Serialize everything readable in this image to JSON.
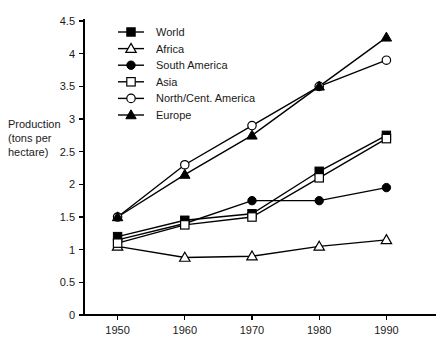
{
  "chart_data": {
    "type": "line",
    "title": "",
    "xlabel": "",
    "ylabel": "Production (tons per hectare)",
    "ylabel_lines": [
      "Production",
      "(tons per",
      "hectare)"
    ],
    "x": [
      1950,
      1960,
      1970,
      1980,
      1990
    ],
    "xtick_labels": [
      "1950",
      "1960",
      "1970",
      "1980",
      "1990"
    ],
    "ytick_labels": [
      "0",
      "0.5",
      "1",
      "1.5",
      "2",
      "2.5",
      "3",
      "3.5",
      "4",
      "4.5"
    ],
    "yticks": [
      0,
      0.5,
      1,
      1.5,
      2,
      2.5,
      3,
      3.5,
      4,
      4.5
    ],
    "ylim": [
      0,
      4.5
    ],
    "xlim": [
      1945,
      1995
    ],
    "grid": false,
    "legend_position": "top-left-inside",
    "series": [
      {
        "name": "World",
        "marker": "filled-square",
        "values": [
          1.2,
          1.45,
          1.55,
          2.2,
          2.75
        ]
      },
      {
        "name": "Africa",
        "marker": "open-triangle",
        "values": [
          1.05,
          0.88,
          0.9,
          1.05,
          1.15
        ]
      },
      {
        "name": "South America",
        "marker": "filled-circle",
        "values": [
          1.15,
          1.4,
          1.75,
          1.75,
          1.95
        ]
      },
      {
        "name": "Asia",
        "marker": "open-square",
        "values": [
          1.1,
          1.38,
          1.5,
          2.1,
          2.7
        ]
      },
      {
        "name": "North/Cent. America",
        "marker": "open-circle",
        "values": [
          1.5,
          2.3,
          2.9,
          3.5,
          3.9
        ]
      },
      {
        "name": "Europe",
        "marker": "filled-triangle",
        "values": [
          1.5,
          2.15,
          2.75,
          3.5,
          4.25
        ]
      }
    ]
  }
}
